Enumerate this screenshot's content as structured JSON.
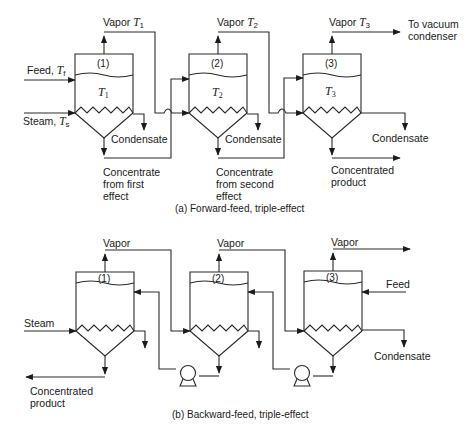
{
  "diagram": {
    "part_a": {
      "caption": "(a) Forward-feed, triple-effect",
      "effects": [
        {
          "id": "(1)",
          "temp_symbol": "T",
          "temp_sub": "1"
        },
        {
          "id": "(2)",
          "temp_symbol": "T",
          "temp_sub": "2"
        },
        {
          "id": "(3)",
          "temp_symbol": "T",
          "temp_sub": "3"
        }
      ],
      "labels": {
        "vapor1": "Vapor ",
        "vapor1_sym": "T",
        "vapor1_sub": "1",
        "vapor2": "Vapor ",
        "vapor2_sym": "T",
        "vapor2_sub": "2",
        "vapor3": "Vapor ",
        "vapor3_sym": "T",
        "vapor3_sub": "3",
        "vacuum": "To vacuum\ncondenser",
        "feed": "Feed, ",
        "feed_sym": "T",
        "feed_sub": "f",
        "steam": "Steam, ",
        "steam_sym": "T",
        "steam_sub": "s",
        "condensate1": "Condensate",
        "condensate2": "Condensate",
        "condensate3": "Condensate",
        "concentrate1": "Concentrate\nfrom first\neffect",
        "concentrate2": "Concentrate\nfrom second\neffect",
        "product": "Concentrated\nproduct"
      }
    },
    "part_b": {
      "caption": "(b) Backward-feed, triple-effect",
      "effects": [
        {
          "id": "(1)"
        },
        {
          "id": "(2)"
        },
        {
          "id": "(3)"
        }
      ],
      "labels": {
        "vapor1": "Vapor",
        "vapor2": "Vapor",
        "vapor3": "Vapor",
        "steam": "Steam",
        "feed": "Feed",
        "condensate": "Condensate",
        "product": "Concentrated\nproduct"
      }
    }
  }
}
